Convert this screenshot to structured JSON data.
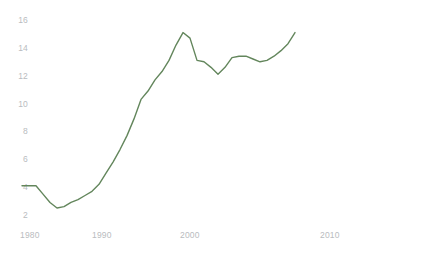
{
  "chart_data": {
    "type": "line",
    "title": "",
    "subtitle": "",
    "xlabel": "",
    "ylabel": "",
    "xlim": [
      1980,
      2019
    ],
    "ylim": [
      2,
      16
    ],
    "grid": false,
    "legend": false,
    "legend_position": "none",
    "line_color": "#63865c",
    "line_width": 1.4,
    "background_color": "#ffffff",
    "tick_label_color": "#b9bcc0",
    "y_ticks": [
      2,
      4,
      6,
      8,
      10,
      12,
      14,
      16
    ],
    "y_tick_labels": [
      "2",
      "4",
      "6",
      "8",
      "10",
      "12",
      "14",
      "16"
    ],
    "x_ticks": [
      1980,
      1990,
      2000,
      2010
    ],
    "x_tick_labels": [
      "1980",
      "1990",
      "2000",
      "2010"
    ],
    "series": [
      {
        "name": "series-1",
        "color": "#63865c",
        "x": [
          1980,
          1981,
          1982,
          1983,
          1984,
          1985,
          1986,
          1987,
          1988,
          1989,
          1990,
          1991,
          1992,
          1993,
          1994,
          1995,
          1996,
          1997,
          1998,
          1999,
          2000,
          2001,
          2002,
          2003,
          2004,
          2005,
          2006,
          2007,
          2008,
          2009,
          2010,
          2011,
          2012,
          2013,
          2014,
          2015,
          2016,
          2017,
          2018,
          2019
        ],
        "values": [
          4.1,
          4.1,
          4.1,
          3.5,
          2.9,
          2.5,
          2.6,
          2.9,
          3.1,
          3.4,
          3.7,
          4.2,
          5.0,
          5.8,
          6.7,
          7.7,
          8.9,
          10.3,
          10.9,
          11.7,
          12.3,
          13.1,
          14.2,
          15.1,
          14.7,
          13.1,
          13.0,
          12.6,
          12.1,
          12.6,
          13.3,
          13.4,
          13.4,
          13.2,
          13.0,
          13.1,
          13.4,
          13.8,
          14.3,
          15.1
        ]
      }
    ]
  }
}
